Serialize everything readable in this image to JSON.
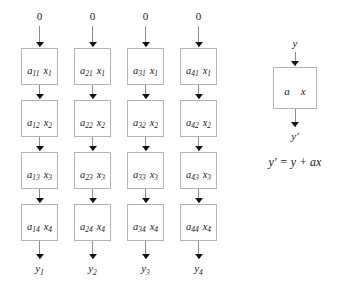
{
  "figure": {
    "line_color": "#8c8c8c",
    "box_border_color": "#b4b4b4",
    "arrow_color": "#111111",
    "background": "#ffffff"
  },
  "array": {
    "columns": [
      {
        "input_label": "0",
        "output_label": "y",
        "output_sub": "1",
        "cells": [
          {
            "a": "a",
            "a_sub": "11",
            "x": "x",
            "x_sub": "1"
          },
          {
            "a": "a",
            "a_sub": "12",
            "x": "x",
            "x_sub": "2"
          },
          {
            "a": "a",
            "a_sub": "13",
            "x": "x",
            "x_sub": "3"
          },
          {
            "a": "a",
            "a_sub": "14",
            "x": "x",
            "x_sub": "4"
          }
        ]
      },
      {
        "input_label": "0",
        "output_label": "y",
        "output_sub": "2",
        "cells": [
          {
            "a": "a",
            "a_sub": "21",
            "x": "x",
            "x_sub": "1"
          },
          {
            "a": "a",
            "a_sub": "22",
            "x": "x",
            "x_sub": "2"
          },
          {
            "a": "a",
            "a_sub": "23",
            "x": "x",
            "x_sub": "3"
          },
          {
            "a": "a",
            "a_sub": "24",
            "x": "x",
            "x_sub": "4"
          }
        ]
      },
      {
        "input_label": "0",
        "output_label": "y",
        "output_sub": "3",
        "cells": [
          {
            "a": "a",
            "a_sub": "31",
            "x": "x",
            "x_sub": "1"
          },
          {
            "a": "a",
            "a_sub": "32",
            "x": "x",
            "x_sub": "2"
          },
          {
            "a": "a",
            "a_sub": "33",
            "x": "x",
            "x_sub": "3"
          },
          {
            "a": "a",
            "a_sub": "34",
            "x": "x",
            "x_sub": "4"
          }
        ]
      },
      {
        "input_label": "0",
        "output_label": "y",
        "output_sub": "4",
        "cells": [
          {
            "a": "a",
            "a_sub": "41",
            "x": "x",
            "x_sub": "1"
          },
          {
            "a": "a",
            "a_sub": "42",
            "x": "x",
            "x_sub": "2"
          },
          {
            "a": "a",
            "a_sub": "43",
            "x": "x",
            "x_sub": "3"
          },
          {
            "a": "a",
            "a_sub": "44",
            "x": "x",
            "x_sub": "4"
          }
        ]
      }
    ]
  },
  "legend": {
    "input_label": "y",
    "cell": {
      "a": "a",
      "x": "x"
    },
    "output_label": "y′",
    "formula": "y′ = y + ax"
  }
}
